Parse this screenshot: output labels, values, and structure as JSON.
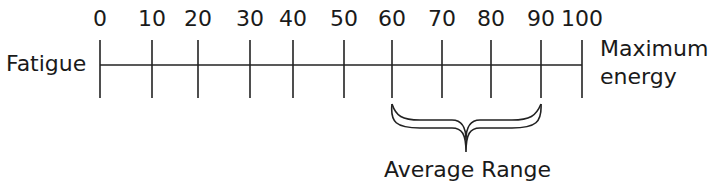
{
  "diagram": {
    "type": "number-line",
    "left_label": "Fatigue",
    "right_label_line1": "Maximum",
    "right_label_line2": "energy",
    "ticks": [
      "0",
      "10",
      "20",
      "30",
      "40",
      "50",
      "60",
      "70",
      "80",
      "90",
      "100"
    ],
    "range_min": 0,
    "range_max": 100,
    "bracket": {
      "from": 60,
      "to": 90,
      "label": "Average Range"
    }
  }
}
